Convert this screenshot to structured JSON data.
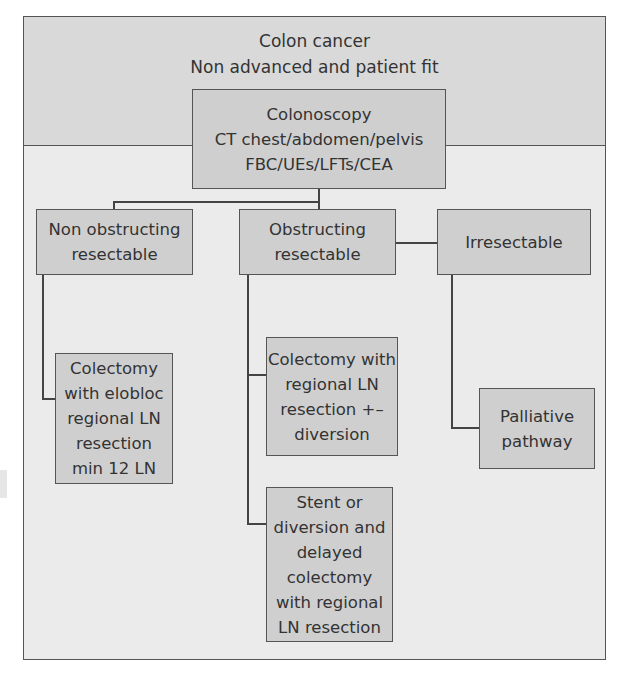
{
  "diagram": {
    "header": {
      "line1": "Colon cancer",
      "line2": "Non advanced and patient fit"
    },
    "nodes": {
      "workup": "Colonoscopy\nCT chest/abdomen/pelvis\nFBC/UEs/LFTs/CEA",
      "non_obstructing": "Non obstructing\nresectable",
      "obstructing": "Obstructing\nresectable",
      "irresectable": "Irresectable",
      "colectomy_enbloc": "Colectomy\nwith elobloc\nregional LN\nresection\nmin 12 LN",
      "colectomy_diversion": "Colectomy with\nregional LN\nresection +–\ndiversion",
      "stent_diversion": "Stent or\ndiversion and\ndelayed\ncolectomy\nwith regional\nLN resection",
      "palliative": "Palliative\npathway"
    },
    "edges": [
      [
        "workup",
        "non_obstructing"
      ],
      [
        "workup",
        "obstructing"
      ],
      [
        "obstructing",
        "irresectable"
      ],
      [
        "non_obstructing",
        "colectomy_enbloc"
      ],
      [
        "obstructing",
        "colectomy_diversion"
      ],
      [
        "obstructing",
        "stent_diversion"
      ],
      [
        "irresectable",
        "palliative"
      ]
    ],
    "colors": {
      "header_bg": "#d9d9d9",
      "body_bg": "#ebebeb",
      "box_bg": "#cfcfcf",
      "border": "#555555"
    }
  }
}
